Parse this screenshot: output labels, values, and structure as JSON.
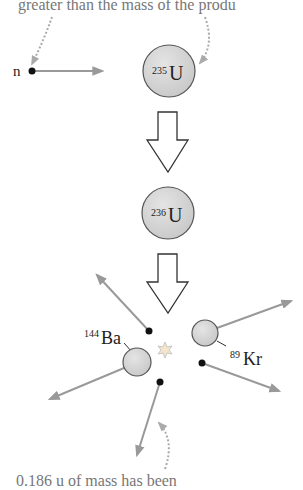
{
  "captions": {
    "top": "greater than the mass of the produ",
    "bottom": "0.186 u of mass has been"
  },
  "particles": {
    "neutron": "n",
    "u235": {
      "mass": "235",
      "symbol": "U"
    },
    "u236": {
      "mass": "236",
      "symbol": "U"
    },
    "ba144": {
      "mass": "144",
      "symbol": "Ba"
    },
    "kr89": {
      "mass": "89",
      "symbol": "Kr"
    }
  },
  "colors": {
    "nucleus_fill": "#d4d4d4",
    "nucleus_stroke": "#555555",
    "arrow_gray": "#999999",
    "caption_gray": "#777777",
    "text_dark": "#222222"
  }
}
